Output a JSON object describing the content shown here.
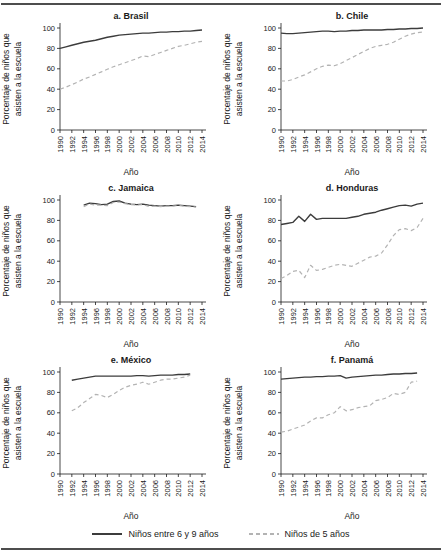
{
  "colors": {
    "solid_line": "#3c3c3c",
    "dashed_line": "#b3b3b3",
    "axis": "#1a1a1a",
    "rule": "#4d4d4d",
    "background": "#ffffff"
  },
  "axes": {
    "xlabel": "Año",
    "ylabel_lines": [
      "Porcentaje de niños que",
      "asisten a la escuela"
    ],
    "x_ticks": [
      1990,
      1992,
      1994,
      1996,
      1998,
      2000,
      2002,
      2004,
      2006,
      2008,
      2010,
      2012,
      2014
    ],
    "y_ticks": [
      0,
      20,
      40,
      60,
      80,
      100
    ],
    "xlim": [
      1990,
      2014
    ],
    "ylim": [
      0,
      100
    ],
    "grid": false
  },
  "legend": {
    "position": "bottom-center",
    "items": [
      {
        "label": "Niños entre 6 y 9 años",
        "style": "solid"
      },
      {
        "label": "Niños de 5 años",
        "style": "dashed"
      }
    ]
  },
  "chart_data": [
    {
      "type": "line",
      "title": "a. Brasil",
      "start_year": 1990,
      "series": [
        {
          "name": "Niños entre 6 y 9 años",
          "style": "solid",
          "values": [
            80,
            81.5,
            83,
            84.5,
            86,
            87,
            88,
            89.5,
            91,
            92,
            93,
            93.5,
            94,
            94.5,
            95,
            95,
            95.5,
            96,
            96,
            96.5,
            96.5,
            97,
            97,
            97.5,
            98
          ]
        },
        {
          "name": "Niños de 5 años",
          "style": "dashed",
          "values": [
            40,
            42,
            44.5,
            47,
            50,
            52,
            54.5,
            57,
            59.5,
            62,
            64,
            66,
            68,
            70,
            72.5,
            72,
            74,
            76,
            78,
            80,
            82,
            83,
            84.5,
            86,
            87
          ]
        }
      ]
    },
    {
      "type": "line",
      "title": "b. Chile",
      "start_year": 1990,
      "series": [
        {
          "name": "Niños entre 6 y 9 años",
          "style": "solid",
          "values": [
            95,
            94.5,
            94.5,
            95,
            95.5,
            96,
            96.5,
            97,
            97,
            96.5,
            97,
            97,
            97.5,
            97.5,
            98,
            98,
            98,
            98,
            98.5,
            98.5,
            99,
            99,
            99.5,
            99.5,
            100
          ]
        },
        {
          "name": "Niños de 5 años",
          "style": "dashed",
          "values": [
            48,
            48,
            49.5,
            52,
            54,
            57,
            60,
            62.5,
            63.5,
            63,
            65,
            68,
            71,
            74,
            77,
            80,
            82,
            83,
            84,
            86,
            89,
            92,
            94,
            95.5,
            96
          ]
        }
      ]
    },
    {
      "type": "line",
      "title": "c. Jamaica",
      "start_year": 1994,
      "series": [
        {
          "name": "Niños entre 6 y 9 años",
          "style": "solid",
          "values": [
            95,
            97,
            96.5,
            95.5,
            96,
            98.5,
            99,
            97,
            96,
            95.5,
            96,
            95,
            94.5,
            94,
            94.5,
            94.5,
            95,
            94.5,
            94,
            93.5
          ]
        },
        {
          "name": "Niños de 5 años",
          "style": "dashed",
          "values": [
            93.5,
            96,
            95,
            95,
            94.5,
            97.5,
            98,
            96.5,
            95.5,
            95,
            95.5,
            93.5,
            94,
            93.5,
            94,
            94,
            94.5,
            94,
            93.5,
            93
          ]
        }
      ]
    },
    {
      "type": "line",
      "title": "d. Honduras",
      "start_year": 1990,
      "series": [
        {
          "name": "Niños entre 6 y 9 años",
          "style": "solid",
          "values": [
            76,
            77,
            78,
            84,
            79,
            86,
            81,
            82,
            82,
            82,
            82,
            82,
            83,
            84,
            86,
            87,
            88,
            90,
            91.5,
            93,
            94.5,
            95,
            94,
            96,
            97
          ]
        },
        {
          "name": "Niños de 5 años",
          "style": "dashed",
          "values": [
            23,
            26,
            30,
            31,
            24,
            36,
            31,
            32,
            34,
            36,
            37,
            36,
            35,
            38,
            41,
            44,
            45,
            48,
            56,
            65,
            71,
            72,
            70,
            73,
            82
          ]
        }
      ]
    },
    {
      "type": "line",
      "title": "e. México",
      "start_year": 1992,
      "series": [
        {
          "name": "Niños entre 6 y 9 años",
          "style": "solid",
          "values": [
            92,
            93,
            94,
            95,
            96,
            96,
            96,
            96,
            96,
            96,
            96,
            96.5,
            96.5,
            96,
            96.5,
            97,
            97,
            97,
            97.5,
            97.5,
            98
          ]
        },
        {
          "name": "Niños de 5 años",
          "style": "dashed",
          "values": [
            62,
            65,
            70,
            74,
            78,
            77,
            75,
            78,
            82,
            85,
            87,
            88,
            90,
            88,
            90,
            92,
            93,
            93,
            94,
            95,
            97
          ]
        }
      ]
    },
    {
      "type": "line",
      "title": "f. Panamá",
      "start_year": 1990,
      "series": [
        {
          "name": "Niños entre 6 y 9 años",
          "style": "solid",
          "values": [
            93,
            93.5,
            94,
            94.5,
            95,
            95,
            95.5,
            95.5,
            96,
            96,
            96.5,
            94,
            95,
            95.5,
            96,
            96.5,
            97,
            97,
            97.5,
            98,
            98,
            98.5,
            98.5,
            99
          ]
        },
        {
          "name": "Niños de 5 años",
          "style": "dashed",
          "values": [
            41,
            42,
            44,
            46,
            48,
            52,
            55,
            55,
            58,
            60,
            66,
            62,
            63,
            65,
            66,
            67,
            72,
            73,
            75,
            79,
            78,
            80,
            90,
            91
          ]
        }
      ]
    }
  ]
}
